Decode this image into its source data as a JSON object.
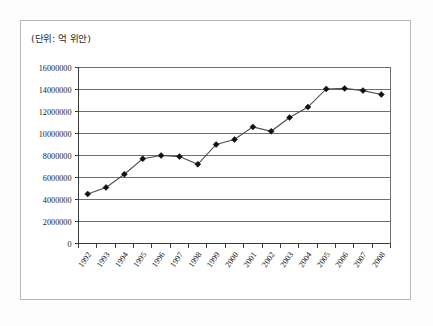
{
  "figure": {
    "unit_label": "(단위: 억 위안)",
    "background_color": "#ffffff",
    "border_color": "#b9b9b9"
  },
  "chart_data": {
    "type": "line",
    "title": "",
    "subtitle": "",
    "annotation": "(단위: 억 위안)",
    "xlabel": "",
    "ylabel": "",
    "categories": [
      "1992",
      "1993",
      "1994",
      "1995",
      "1996",
      "1997",
      "1998",
      "1999",
      "2000",
      "2001",
      "2002",
      "2003",
      "2004",
      "2005",
      "2006",
      "2007",
      "2008"
    ],
    "values": [
      4500000,
      5100000,
      6300000,
      7700000,
      8000000,
      7900000,
      7200000,
      9000000,
      9450000,
      10600000,
      10200000,
      11450000,
      12400000,
      14050000,
      14100000,
      13900000,
      13550000
    ],
    "series": [
      {
        "name": "series-1",
        "marker": "diamond",
        "line_color": "#4d4d4d",
        "marker_color": "#111111",
        "values": [
          4500000,
          5100000,
          6300000,
          7700000,
          8000000,
          7900000,
          7200000,
          9000000,
          9450000,
          10600000,
          10200000,
          11450000,
          12400000,
          14050000,
          14100000,
          13900000,
          13550000
        ]
      }
    ],
    "ylim": [
      0,
      16000000
    ],
    "ytick_labels": [
      "0",
      "2000000",
      "4000000",
      "6000000",
      "8000000",
      "10000000",
      "12000000",
      "14000000",
      "16000000"
    ],
    "ytick_values": [
      0,
      2000000,
      4000000,
      6000000,
      8000000,
      10000000,
      12000000,
      14000000,
      16000000
    ],
    "xtick_labels": [
      "1992",
      "1993",
      "1994",
      "1995",
      "1996",
      "1997",
      "1998",
      "1999",
      "2000",
      "2001",
      "2002",
      "2003",
      "2004",
      "2005",
      "2006",
      "2007",
      "2008"
    ],
    "grid": "horizontal",
    "legend": "none",
    "legend_position": "none",
    "gridline_color": "#6e6e6e",
    "axis_color": "#3a3a3a"
  }
}
